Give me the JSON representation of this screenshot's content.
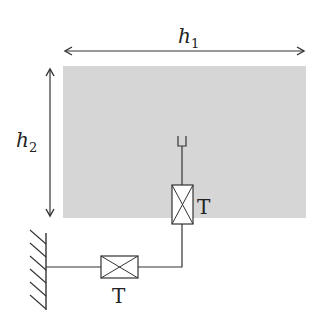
{
  "diagram": {
    "labels": {
      "width_dim": "h",
      "width_sub": "1",
      "height_dim": "h",
      "height_sub": "2",
      "thruster_vertical": "T",
      "thruster_horizontal": "T"
    },
    "colors": {
      "region_fill": "#d6d6d6",
      "stroke": "#333333",
      "background": "#ffffff"
    }
  }
}
